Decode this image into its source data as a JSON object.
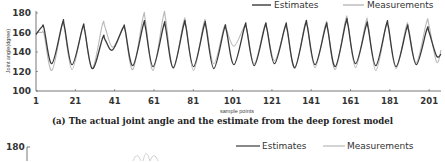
{
  "chart_data": {
    "type": "line",
    "title": "",
    "caption": "(a) The actual joint angle and the estimate from the deep forest model",
    "xlabel": "sample points",
    "ylabel": "Joint angle(dgree)",
    "ylim": [
      100,
      180
    ],
    "yticks": [
      100,
      120,
      140,
      160,
      180
    ],
    "xticks": [
      1,
      21,
      41,
      61,
      81,
      101,
      121,
      141,
      161,
      181,
      201
    ],
    "xlim": [
      1,
      207
    ],
    "grid": false,
    "legend_position": "top-right",
    "series": [
      {
        "name": "Estimates",
        "color": "#3a3a3a",
        "cycles": [
          {
            "peak": 166,
            "trough": 128
          },
          {
            "peak": 169,
            "trough": 127
          },
          {
            "peak": 165,
            "trough": 123
          },
          {
            "peak": 155,
            "trough": 142
          },
          {
            "peak": 165,
            "trough": 126
          },
          {
            "peak": 168,
            "trough": 125
          },
          {
            "peak": 167,
            "trough": 124
          },
          {
            "peak": 168,
            "trough": 125
          },
          {
            "peak": 167,
            "trough": 123
          },
          {
            "peak": 164,
            "trough": 127
          },
          {
            "peak": 166,
            "trough": 126
          },
          {
            "peak": 166,
            "trough": 128
          },
          {
            "peak": 166,
            "trough": 124
          },
          {
            "peak": 168,
            "trough": 127
          },
          {
            "peak": 166,
            "trough": 125
          },
          {
            "peak": 170,
            "trough": 128
          },
          {
            "peak": 167,
            "trough": 126
          },
          {
            "peak": 168,
            "trough": 125
          },
          {
            "peak": 164,
            "trough": 127
          },
          {
            "peak": 163,
            "trough": 136
          }
        ]
      },
      {
        "name": "Measurements",
        "color": "#b8b8b8",
        "cycles": [
          {
            "peak": 160,
            "trough": 121
          },
          {
            "peak": 167,
            "trough": 122
          },
          {
            "peak": 164,
            "trough": 123
          },
          {
            "peak": 168,
            "trough": 145
          },
          {
            "peak": 164,
            "trough": 122
          },
          {
            "peak": 175,
            "trough": 121
          },
          {
            "peak": 176,
            "trough": 123
          },
          {
            "peak": 170,
            "trough": 121
          },
          {
            "peak": 169,
            "trough": 128
          },
          {
            "peak": 165,
            "trough": 146
          },
          {
            "peak": 166,
            "trough": 128
          },
          {
            "peak": 166,
            "trough": 131
          },
          {
            "peak": 164,
            "trough": 123
          },
          {
            "peak": 168,
            "trough": 124
          },
          {
            "peak": 167,
            "trough": 122
          },
          {
            "peak": 172,
            "trough": 124
          },
          {
            "peak": 170,
            "trough": 121
          },
          {
            "peak": 166,
            "trough": 123
          },
          {
            "peak": 166,
            "trough": 129
          },
          {
            "peak": 170,
            "trough": 130
          }
        ]
      }
    ]
  },
  "legend": {
    "estimates_label": "Estimates",
    "measurements_label": "Measurements"
  },
  "bottom_chart": {
    "ytick_top": "180",
    "legend_estimates": "Estimates",
    "legend_measurements": "Measurements"
  },
  "caption_prefix": "(a) The actual joint",
  "caption_rest": " angle and the estimate from the deep forest model"
}
